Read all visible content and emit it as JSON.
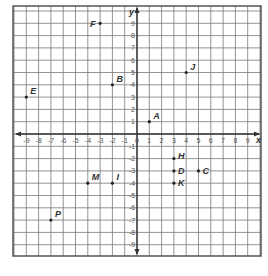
{
  "chart_data": {
    "type": "scatter",
    "title": "",
    "xlabel": "x",
    "ylabel": "y",
    "xlim": [
      -9,
      9
    ],
    "ylim": [
      -9,
      9
    ],
    "grid": true,
    "x_ticks": [
      "-9",
      "-8",
      "-7",
      "-6",
      "-5",
      "-4",
      "-3",
      "-2",
      "-1",
      "0",
      "1",
      "2",
      "3",
      "4",
      "5",
      "6",
      "7",
      "8",
      "9"
    ],
    "y_ticks": [
      "9",
      "8",
      "7",
      "6",
      "5",
      "4",
      "3",
      "2",
      "1",
      "-1",
      "-2",
      "-3",
      "-4",
      "-5",
      "-6",
      "-7",
      "-8",
      "-9"
    ],
    "points": [
      {
        "label": "A",
        "x": 1,
        "y": 1
      },
      {
        "label": "B",
        "x": -2,
        "y": 4
      },
      {
        "label": "C",
        "x": 5,
        "y": -3
      },
      {
        "label": "D",
        "x": 3,
        "y": -3
      },
      {
        "label": "E",
        "x": -9,
        "y": 3
      },
      {
        "label": "F",
        "x": -3,
        "y": 9
      },
      {
        "label": "H",
        "x": 3,
        "y": -2
      },
      {
        "label": "I",
        "x": -2,
        "y": -4
      },
      {
        "label": "J",
        "x": 4,
        "y": 5
      },
      {
        "label": "K",
        "x": 3,
        "y": -4
      },
      {
        "label": "M",
        "x": -4,
        "y": -4
      },
      {
        "label": "P",
        "x": -7,
        "y": -7
      }
    ]
  },
  "colors": {
    "grid": "#777777",
    "axis": "#333333",
    "frame": "#555555",
    "point": "#222222"
  }
}
